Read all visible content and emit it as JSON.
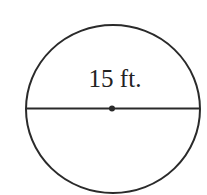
{
  "diagram": {
    "shape": "circle",
    "diameter_label": "15 ft.",
    "stroke_color": "#2a2a2a",
    "background": "#ffffff",
    "elements": [
      "circle-outline",
      "diameter-line",
      "center-point",
      "diameter-label"
    ]
  }
}
